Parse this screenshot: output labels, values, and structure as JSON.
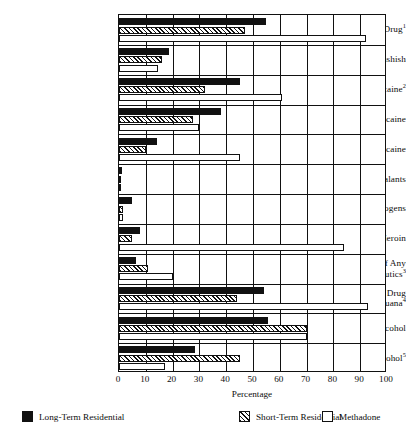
{
  "chart_data": {
    "type": "bar",
    "orientation": "horizontal",
    "title": "",
    "xlabel": "Percentage",
    "ylabel": "",
    "xlim": [
      0,
      100
    ],
    "xticks": [
      0,
      10,
      20,
      30,
      40,
      50,
      60,
      70,
      80,
      90,
      100
    ],
    "grid": true,
    "grid_axis": "x",
    "legend_position": "bottom",
    "categories": [
      "Any Illicit Drug",
      "Marijuana/Hashish",
      "Any Cocaine",
      "Crack Cocaine",
      "Other Cocaine",
      "Inhalants",
      "Hallucinogens",
      "Heroin",
      "Nonmedical Use of Any Psychotherapeutics",
      "Any Illicit Drug Except Marijuana",
      "Any Alcohol",
      "Heavy Alcohol"
    ],
    "category_footnotes": [
      "1",
      "",
      "2",
      "",
      "",
      "",
      "",
      "",
      "3",
      "4",
      "",
      "5"
    ],
    "series": [
      {
        "name": "Long-Term Residential",
        "fill": "solid-black",
        "color": "#111111",
        "values": [
          55,
          18.5,
          45,
          38,
          14,
          1,
          5,
          8,
          6.5,
          54,
          55.5,
          28.5
        ]
      },
      {
        "name": "Short-Term Residential",
        "fill": "hatched",
        "color": "#111111",
        "values": [
          47,
          16,
          32,
          27.5,
          10,
          0.5,
          1.5,
          5,
          11,
          44,
          70,
          45
        ]
      },
      {
        "name": "Methadone",
        "fill": "white",
        "color": "#ffffff",
        "values": [
          92,
          14.5,
          61,
          30,
          45,
          0.5,
          1.5,
          84,
          20,
          93,
          70,
          17
        ]
      }
    ]
  },
  "legend": {
    "items": [
      {
        "label": "Long-Term Residential",
        "swatch": "solid-black"
      },
      {
        "label": "Short-Term Residential",
        "swatch": "hatched"
      },
      {
        "label": "Methadone",
        "swatch": "white"
      }
    ]
  },
  "axis": {
    "x_title": "Percentage",
    "x_tick_labels": [
      "0",
      "10",
      "20",
      "30",
      "40",
      "50",
      "60",
      "70",
      "80",
      "90",
      "100"
    ]
  }
}
